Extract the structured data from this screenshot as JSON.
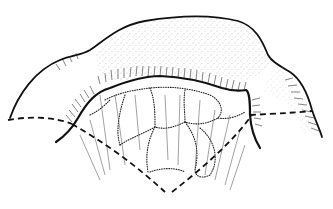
{
  "illustration": {
    "style": "pen-and-ink line drawing",
    "colors": {
      "background": "#ffffff",
      "ink": "#111111",
      "stipple": "#555555",
      "hatch": "#333333"
    },
    "elements": [
      "outer-dome-outline",
      "left-lobe-outline",
      "right-lobe-outline",
      "inner-rim-line",
      "stippled-dome-shading",
      "rim-hatching",
      "dotted-cell-outlines",
      "dashed-left-horizontal-line",
      "dashed-right-horizontal-line",
      "dashed-v-lines",
      "radiating-striations"
    ]
  }
}
